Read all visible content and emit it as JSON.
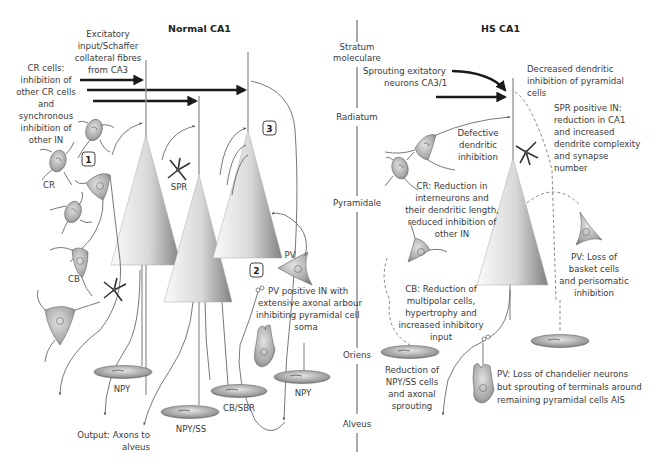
{
  "titles": {
    "normal": "Normal CA1",
    "hs": "HS CA1"
  },
  "layers": [
    "Stratum",
    "moleculare",
    "Radiatum",
    "Pyramidale",
    "Oriens",
    "Alveus"
  ],
  "normal": {
    "excitatory_input": [
      "Excitatory",
      "input/Schaffer",
      "collateral fibres",
      "from CA3"
    ],
    "cr_cells_note": [
      "CR cells:",
      "inhibition of",
      "other CR cells",
      "and",
      "synchronous",
      "inhibition of",
      "other IN"
    ],
    "cell_labels": {
      "cr": "CR",
      "cb": "CB",
      "spr": "SPR",
      "pv": "PV",
      "npy_left": "NPY",
      "npy_ss": "NPY/SS",
      "cb_sbr": "CB/SBR",
      "npy_right": "NPY"
    },
    "pv_note": [
      "PV positive IN with",
      "extensive axonal arbour",
      "inhibiting pyramidal cell",
      "soma"
    ],
    "output_note": [
      "Output: Axons to",
      "alveus"
    ],
    "markers": [
      "1",
      "2",
      "3"
    ]
  },
  "hs": {
    "sprouting_note": [
      "Sprouting exitatory",
      "neurons CA3/1"
    ],
    "decreased_note": [
      "Decreased  dendritic",
      "inhibition of pyramidal",
      "cells"
    ],
    "spr_note": [
      "SPR positive IN:",
      "reduction in CA1",
      "and increased",
      "dendrite complexity",
      "and synapse",
      "number"
    ],
    "defective_note": [
      "Defective",
      "dendritic",
      "inhibition"
    ],
    "cr_note": [
      "CR: Reduction in",
      "interneurons and",
      "their dendritic length,",
      "reduced inhibition of",
      "other IN"
    ],
    "pv_basket_note": [
      "PV: Loss of",
      "basket cells",
      "and perisomatic",
      "inhibition"
    ],
    "cb_note": [
      "CB: Reduction of",
      "multipolar cells,",
      "hypertrophy and",
      "increased inhibitory",
      "input"
    ],
    "npy_note": [
      "Reduction of",
      "NPY/SS cells",
      "and axonal",
      "sprouting"
    ],
    "pv_chandelier_note": [
      "PV: Loss of chandelier neurons",
      "but sprouting of terminals around",
      "remaining pyramidal cells AIS"
    ]
  },
  "colors": {
    "text": "#3a3a3a",
    "arrow": "#1a1a1a",
    "cell_fill": "#b5b5b5",
    "pyramid_light": "#f4f4f4",
    "pyramid_dark": "#8a8a8a"
  }
}
